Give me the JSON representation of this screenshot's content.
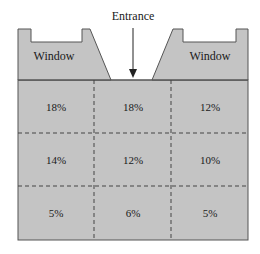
{
  "diagram": {
    "entrance_label": "Entrance",
    "windows": [
      {
        "label": "Window",
        "side": "left"
      },
      {
        "label": "Window",
        "side": "right"
      }
    ],
    "grid": {
      "rows": [
        [
          "18%",
          "18%",
          "12%"
        ],
        [
          "14%",
          "12%",
          "10%"
        ],
        [
          "5%",
          "6%",
          "5%"
        ]
      ]
    },
    "colors": {
      "fill": "#c4c4c4",
      "stroke": "#555555",
      "divider": "#444444",
      "background": "#ffffff"
    }
  }
}
